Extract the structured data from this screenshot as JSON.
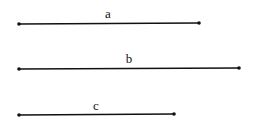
{
  "diagram": {
    "segments": [
      {
        "label": "a",
        "x1": 19,
        "x2": 199,
        "y": 24,
        "label_x": 108,
        "label_y": 18
      },
      {
        "label": "b",
        "x1": 19,
        "x2": 239,
        "y": 68,
        "label_x": 129,
        "label_y": 63
      },
      {
        "label": "c",
        "x1": 19,
        "x2": 174,
        "y": 114,
        "label_x": 96,
        "label_y": 110
      }
    ],
    "colors": {
      "line": "#111111",
      "background": "#ffffff"
    }
  }
}
